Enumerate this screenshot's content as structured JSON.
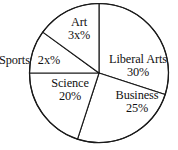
{
  "chart_data": {
    "type": "pie",
    "title": "",
    "subtitle": "",
    "xlabel": "",
    "ylabel": "",
    "legend": "none",
    "grid": false,
    "start_angle_deg": 0,
    "direction": "clockwise",
    "categories": [
      "Liberal Arts",
      "Business",
      "Science",
      "Sports",
      "Art"
    ],
    "values": [
      30,
      25,
      20,
      10,
      15
    ],
    "value_labels": [
      "30%",
      "25%",
      "20%",
      "2x%",
      "3x%"
    ],
    "slices": [
      {
        "label": "Liberal Arts",
        "value_label": "30%",
        "value": 30,
        "start_deg": 0,
        "end_deg": 108,
        "fill": "#ffffff",
        "stroke": "#1a1a1a"
      },
      {
        "label": "Business",
        "value_label": "25%",
        "value": 25,
        "start_deg": 108,
        "end_deg": 198,
        "fill": "#ffffff",
        "stroke": "#1a1a1a"
      },
      {
        "label": "Science",
        "value_label": "20%",
        "value": 20,
        "start_deg": 198,
        "end_deg": 270,
        "fill": "#ffffff",
        "stroke": "#1a1a1a"
      },
      {
        "label": "Sports",
        "value_label": "2x%",
        "value": 10,
        "start_deg": 270,
        "end_deg": 306,
        "fill": "#ffffff",
        "stroke": "#1a1a1a"
      },
      {
        "label": "Art",
        "value_label": "3x%",
        "value": 15,
        "start_deg": 306,
        "end_deg": 360,
        "fill": "#ffffff",
        "stroke": "#1a1a1a"
      }
    ],
    "geometry": {
      "center_x": 99,
      "center_y": 73,
      "radius": 69.5
    },
    "colors": {
      "background": "#ffffff",
      "outline": "#1a1a1a",
      "text": "#111111"
    }
  }
}
